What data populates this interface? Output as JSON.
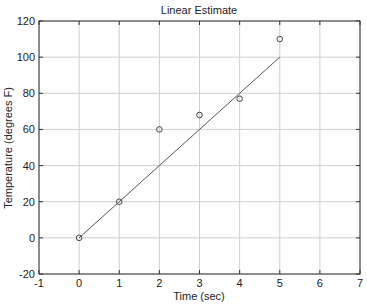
{
  "chart_data": {
    "type": "scatter",
    "title": "Linear Estimate",
    "xlabel": "Time (sec)",
    "ylabel": "Temperature (degrees F)",
    "xlim": [
      -1,
      7
    ],
    "ylim": [
      -20,
      120
    ],
    "xticks": [
      -1,
      0,
      1,
      2,
      3,
      4,
      5,
      6,
      7
    ],
    "yticks": [
      -20,
      0,
      20,
      40,
      60,
      80,
      100,
      120
    ],
    "grid": true,
    "legend": null,
    "series": [
      {
        "name": "Measured",
        "style": "markers-circle",
        "x": [
          0,
          1,
          2,
          3,
          4,
          5
        ],
        "y": [
          0,
          20,
          60,
          68,
          77,
          110
        ]
      },
      {
        "name": "Linear fit",
        "style": "line",
        "x": [
          0,
          1,
          2,
          3,
          4,
          5
        ],
        "y": [
          0,
          20,
          40,
          60,
          80,
          100
        ]
      }
    ]
  }
}
